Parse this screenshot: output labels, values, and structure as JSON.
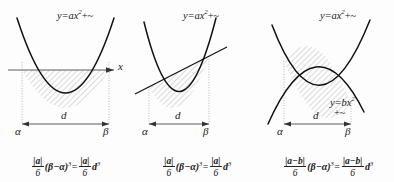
{
  "figure": {
    "hatch_color": "#8c8c8c",
    "curve_color": "#1a1a1a",
    "guide_color": "#9a9a9a"
  },
  "panels": [
    {
      "id": "panel-1",
      "curve_label": "y=ax",
      "curve_label_exp": "2",
      "curve_label_tail": "+~",
      "second_label": null,
      "second_label_exp": null,
      "second_label_tail": null,
      "axis_label": "x",
      "left_tick": "α",
      "right_tick": "β",
      "width_label": "d",
      "formula": {
        "lhs_frac_num": "|a|",
        "lhs_frac_den": "6",
        "lhs_factor": "(β−α)",
        "lhs_factor_exp": "3",
        "equals": "=",
        "rhs_frac_num": "|a|",
        "rhs_frac_den": "6",
        "rhs_factor": "d",
        "rhs_factor_exp": "3"
      }
    },
    {
      "id": "panel-2",
      "curve_label": "y=ax",
      "curve_label_exp": "2",
      "curve_label_tail": "+~",
      "second_label": null,
      "second_label_exp": null,
      "second_label_tail": null,
      "axis_label": null,
      "left_tick": "α",
      "right_tick": "β",
      "width_label": "d",
      "formula": {
        "lhs_frac_num": "|a|",
        "lhs_frac_den": "6",
        "lhs_factor": "(β−α)",
        "lhs_factor_exp": "3",
        "equals": "=",
        "rhs_frac_num": "|a|",
        "rhs_frac_den": "6",
        "rhs_factor": "d",
        "rhs_factor_exp": "3"
      }
    },
    {
      "id": "panel-3",
      "curve_label": "y=ax",
      "curve_label_exp": "2",
      "curve_label_tail": "+~",
      "second_label": "y=bx",
      "second_label_exp": "2",
      "second_label_tail": "+~",
      "axis_label": null,
      "left_tick": "α",
      "right_tick": "β",
      "width_label": "d",
      "formula": {
        "lhs_frac_num": "|a−b|",
        "lhs_frac_den": "6",
        "lhs_factor": "(β−α)",
        "lhs_factor_exp": "3",
        "equals": "=",
        "rhs_frac_num": "|a−b|",
        "rhs_frac_den": "6",
        "rhs_factor": "d",
        "rhs_factor_exp": "3"
      }
    }
  ]
}
